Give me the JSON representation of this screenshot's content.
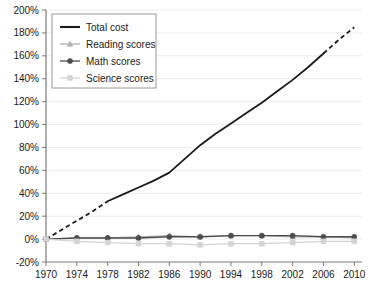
{
  "chart_data": {
    "type": "line",
    "title": "",
    "xlabel": "",
    "ylabel": "",
    "xlim": [
      1970,
      2011
    ],
    "ylim": [
      -20,
      200
    ],
    "ytick_format": "percent",
    "grid": true,
    "grid_axis": "y",
    "legend_position": "top-left",
    "x_ticks": [
      1970,
      1974,
      1978,
      1982,
      1986,
      1990,
      1994,
      1998,
      2002,
      2006,
      2010
    ],
    "x_tick_labels": [
      "1970",
      "1974",
      "1978",
      "1982",
      "1986",
      "1990",
      "1994",
      "1998",
      "2002",
      "2006",
      "2010"
    ],
    "y_ticks": [
      -20,
      0,
      20,
      40,
      60,
      80,
      100,
      120,
      140,
      160,
      180,
      200
    ],
    "y_tick_labels": [
      "-20%",
      "0%",
      "20%",
      "40%",
      "60%",
      "80%",
      "100%",
      "120%",
      "140%",
      "160%",
      "180%",
      "200%"
    ],
    "series": [
      {
        "name": "Total cost",
        "color": "#1a1a1a",
        "marker": "none",
        "width": 1.8,
        "x": [
          1970,
          1972,
          1974,
          1976,
          1978,
          1980,
          1982,
          1984,
          1986,
          1988,
          1990,
          1992,
          1994,
          1996,
          1998,
          2000,
          2002,
          2004,
          2006,
          2008,
          2010
        ],
        "values": [
          0,
          8,
          16,
          24,
          33,
          39,
          45,
          51,
          58,
          70,
          82,
          92,
          101,
          110,
          119,
          129,
          139,
          150,
          162,
          174,
          185
        ],
        "dashed_segments": [
          [
            1970,
            1978
          ],
          [
            2006,
            2010
          ]
        ],
        "solid_segment": [
          1978,
          2006
        ]
      },
      {
        "name": "Reading scores",
        "color": "#b0b0b0",
        "marker": "triangle",
        "width": 1.2,
        "x": [
          1970,
          1974,
          1978,
          1982,
          1986,
          1990,
          1994,
          1998,
          2002,
          2006,
          2010
        ],
        "values": [
          0,
          1,
          1,
          2,
          3,
          2,
          3,
          3,
          2,
          2,
          1
        ]
      },
      {
        "name": "Math scores",
        "color": "#4d4d4d",
        "marker": "circle",
        "width": 1.4,
        "x": [
          1970,
          1974,
          1978,
          1982,
          1986,
          1990,
          1994,
          1998,
          2002,
          2006,
          2010
        ],
        "values": [
          0,
          1,
          1,
          1,
          2,
          2,
          3,
          3,
          3,
          2,
          2
        ]
      },
      {
        "name": "Science scores",
        "color": "#d4d4d4",
        "marker": "square",
        "width": 1.2,
        "x": [
          1970,
          1974,
          1978,
          1982,
          1986,
          1990,
          1994,
          1998,
          2002,
          2006,
          2010
        ],
        "values": [
          0,
          -2,
          -3,
          -4,
          -4,
          -5,
          -4,
          -4,
          -3,
          -2,
          -2
        ]
      }
    ],
    "legend": {
      "entries": [
        {
          "label": "Total cost",
          "color": "#1a1a1a",
          "marker": "none"
        },
        {
          "label": "Reading scores",
          "color": "#b0b0b0",
          "marker": "triangle"
        },
        {
          "label": "Math scores",
          "color": "#4d4d4d",
          "marker": "circle"
        },
        {
          "label": "Science scores",
          "color": "#d4d4d4",
          "marker": "square"
        }
      ]
    },
    "colors": {
      "axis": "#7a7a7a",
      "grid": "#ececf2",
      "text": "#1a1a1a",
      "background": "#ffffff"
    }
  }
}
